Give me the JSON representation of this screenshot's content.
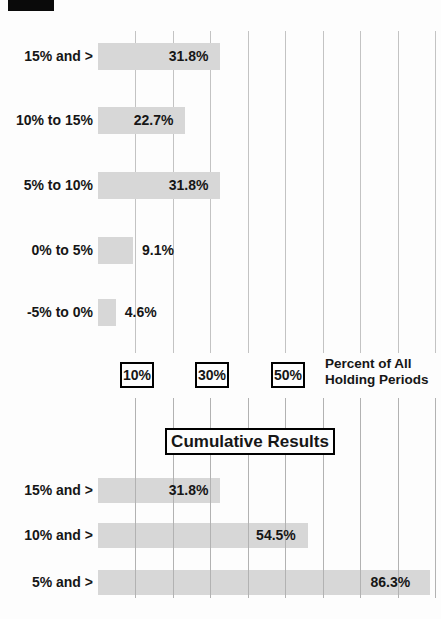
{
  "chart_data": [
    {
      "type": "bar",
      "orientation": "horizontal",
      "categories": [
        "15% and >",
        "10% to 15%",
        "5% to 10%",
        "0% to 5%",
        "-5% to 0%"
      ],
      "values": [
        31.8,
        22.7,
        31.8,
        9.1,
        4.6
      ],
      "value_labels": [
        "31.8%",
        "22.7%",
        "31.8%",
        "9.1%",
        "4.6%"
      ],
      "xlabel": "Percent of All Holding Periods",
      "x_tick_labels": [
        "10%",
        "30%",
        "50%"
      ],
      "x_tick_values": [
        10,
        30,
        50
      ],
      "xlim": [
        0,
        90
      ],
      "gridlines": [
        10,
        20,
        30,
        40,
        50,
        60,
        70,
        80,
        90
      ]
    },
    {
      "type": "bar",
      "orientation": "horizontal",
      "title": "Cumulative Results",
      "categories": [
        "15% and >",
        "10% and >",
        "5% and >"
      ],
      "values": [
        31.8,
        54.5,
        86.3
      ],
      "value_labels": [
        "31.8%",
        "54.5%",
        "86.3%"
      ],
      "xlim": [
        0,
        90
      ],
      "gridlines": [
        10,
        20,
        30,
        40,
        50,
        60,
        70,
        80,
        90
      ]
    }
  ],
  "axis": {
    "tick_boxes": [
      "10%",
      "30%",
      "50%"
    ],
    "caption_lines": [
      "Percent of All",
      "Holding Periods"
    ]
  },
  "colors": {
    "bar_fill": "#d7d7d7",
    "gridline": "#c3c3c3",
    "gridline_dark": "#b2b2b2",
    "text": "#161616",
    "box_border": "#000000",
    "background": "#fdfdfd",
    "scan_mark": "#0a0a0a"
  }
}
